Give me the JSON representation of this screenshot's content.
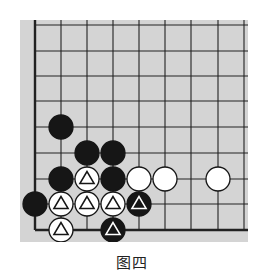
{
  "diagram": {
    "caption": "图四",
    "board": {
      "background": "#d4d4d4",
      "line_color": "#222222",
      "columns": 9,
      "rows": 9,
      "edges": [
        "left",
        "bottom"
      ],
      "grid_x": [
        35,
        61,
        87,
        113,
        139,
        165,
        191,
        218,
        244
      ],
      "grid_y": [
        25,
        51,
        76,
        101,
        127,
        153,
        179,
        204,
        230
      ]
    },
    "stones": [
      {
        "col": 1,
        "row": 4,
        "color": "black",
        "mark": ""
      },
      {
        "col": 2,
        "row": 5,
        "color": "black",
        "mark": ""
      },
      {
        "col": 3,
        "row": 5,
        "color": "black",
        "mark": ""
      },
      {
        "col": 1,
        "row": 6,
        "color": "black",
        "mark": ""
      },
      {
        "col": 2,
        "row": 6,
        "color": "white",
        "mark": "triangle"
      },
      {
        "col": 3,
        "row": 6,
        "color": "black",
        "mark": ""
      },
      {
        "col": 4,
        "row": 6,
        "color": "white",
        "mark": ""
      },
      {
        "col": 5,
        "row": 6,
        "color": "white",
        "mark": ""
      },
      {
        "col": 7,
        "row": 6,
        "color": "white",
        "mark": ""
      },
      {
        "col": 0,
        "row": 7,
        "color": "black",
        "mark": ""
      },
      {
        "col": 1,
        "row": 7,
        "color": "white",
        "mark": "triangle"
      },
      {
        "col": 2,
        "row": 7,
        "color": "white",
        "mark": "triangle"
      },
      {
        "col": 3,
        "row": 7,
        "color": "white",
        "mark": "triangle"
      },
      {
        "col": 4,
        "row": 7,
        "color": "black",
        "mark": "triangle"
      },
      {
        "col": 1,
        "row": 8,
        "color": "white",
        "mark": "triangle"
      },
      {
        "col": 3,
        "row": 8,
        "color": "black",
        "mark": "triangle"
      }
    ]
  }
}
